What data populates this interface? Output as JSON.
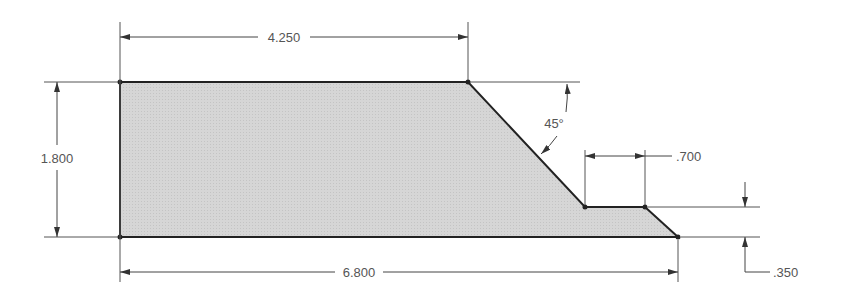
{
  "drawing": {
    "type": "engineering-drawing",
    "part_fill": "#d9d9d9",
    "outline_color": "#222222",
    "dimension_color": "#444444",
    "dimensions": {
      "top_length": "4.250",
      "height": "1.800",
      "angle": "45°",
      "step_length": ".700",
      "step_height": ".350",
      "overall_length": "6.800"
    }
  }
}
